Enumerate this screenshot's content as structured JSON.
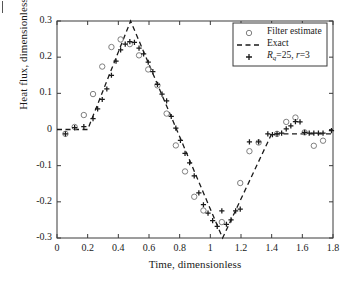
{
  "chart_data": {
    "type": "line",
    "title": "",
    "xlabel": "Time, dimensionless",
    "ylabel": "Heat flux, dimensionless",
    "xlim": [
      0,
      1.8
    ],
    "ylim": [
      -0.3,
      0.3
    ],
    "xticks": [
      "0",
      "0.2",
      "0.4",
      "0.6",
      "0.8",
      "1",
      "1.2",
      "1.4",
      "1.6",
      "1.8"
    ],
    "xtickvals": [
      0,
      0.2,
      0.4,
      0.6,
      0.8,
      1.0,
      1.2,
      1.4,
      1.6,
      1.8
    ],
    "yticks": [
      "0.3",
      "0.2",
      "0.1",
      "0",
      "-0.1",
      "-0.2",
      "-0.3"
    ],
    "ytickvals": [
      0.3,
      0.2,
      0.1,
      0,
      -0.1,
      -0.2,
      -0.3
    ],
    "grid": false,
    "legend_position": "top-right",
    "series": [
      {
        "name": "Filter estimate",
        "marker": "circle",
        "style": "markers",
        "color": "#808080",
        "points": [
          [
            0.055,
            -0.012
          ],
          [
            0.115,
            0.007
          ],
          [
            0.175,
            0.04
          ],
          [
            0.235,
            0.098
          ],
          [
            0.295,
            0.174
          ],
          [
            0.355,
            0.228
          ],
          [
            0.415,
            0.249
          ],
          [
            0.475,
            0.236
          ],
          [
            0.535,
            0.205
          ],
          [
            0.595,
            0.166
          ],
          [
            0.655,
            0.122
          ],
          [
            0.715,
            0.044
          ],
          [
            0.775,
            -0.044
          ],
          [
            0.835,
            -0.116
          ],
          [
            0.895,
            -0.186
          ],
          [
            0.955,
            -0.224
          ],
          [
            1.075,
            -0.256
          ],
          [
            1.195,
            -0.148
          ],
          [
            1.255,
            -0.06
          ],
          [
            1.315,
            -0.036
          ],
          [
            1.435,
            -0.012
          ],
          [
            1.495,
            0.021
          ],
          [
            1.555,
            0.033
          ],
          [
            1.615,
            -0.008
          ],
          [
            1.675,
            -0.045
          ],
          [
            1.735,
            -0.031
          ]
        ]
      },
      {
        "name": "Exact",
        "marker": "none",
        "style": "dashed-line",
        "color": "#1a1a1a",
        "points": [
          [
            0.0,
            0.0
          ],
          [
            0.2,
            0.0
          ],
          [
            0.48,
            0.3
          ],
          [
            1.08,
            -0.3
          ],
          [
            1.4,
            -0.012
          ],
          [
            1.8,
            -0.012
          ]
        ]
      },
      {
        "name": "Rq = 25, r = 3",
        "name_parts": {
          "symbol": "R",
          "subscript": "q",
          "value": "25",
          "r_symbol": "r",
          "r_value": "3"
        },
        "marker": "plus",
        "style": "markers",
        "color": "#1a1a1a",
        "points": [
          [
            0.055,
            -0.012
          ],
          [
            0.115,
            0.005
          ],
          [
            0.175,
            0.008
          ],
          [
            0.235,
            0.03
          ],
          [
            0.265,
            0.057
          ],
          [
            0.295,
            0.083
          ],
          [
            0.325,
            0.112
          ],
          [
            0.355,
            0.15
          ],
          [
            0.385,
            0.189
          ],
          [
            0.415,
            0.22
          ],
          [
            0.445,
            0.236
          ],
          [
            0.475,
            0.243
          ],
          [
            0.505,
            0.241
          ],
          [
            0.535,
            0.225
          ],
          [
            0.565,
            0.209
          ],
          [
            0.595,
            0.186
          ],
          [
            0.625,
            0.16
          ],
          [
            0.655,
            0.125
          ],
          [
            0.685,
            0.098
          ],
          [
            0.715,
            0.079
          ],
          [
            0.745,
            0.036
          ],
          [
            0.775,
            0.004
          ],
          [
            0.805,
            -0.03
          ],
          [
            0.835,
            -0.066
          ],
          [
            0.865,
            -0.092
          ],
          [
            0.895,
            -0.128
          ],
          [
            0.925,
            -0.175
          ],
          [
            0.955,
            -0.208
          ],
          [
            0.985,
            -0.231
          ],
          [
            1.015,
            -0.252
          ],
          [
            1.045,
            -0.268
          ],
          [
            1.075,
            -0.225
          ],
          [
            1.105,
            -0.262
          ],
          [
            1.135,
            -0.25
          ],
          [
            1.165,
            -0.225
          ],
          [
            1.195,
            -0.22
          ],
          [
            1.255,
            -0.034
          ],
          [
            1.315,
            -0.034
          ],
          [
            1.375,
            -0.012
          ],
          [
            1.405,
            -0.014
          ],
          [
            1.435,
            -0.012
          ],
          [
            1.465,
            -0.01
          ],
          [
            1.495,
            0.002
          ],
          [
            1.525,
            0.01
          ],
          [
            1.555,
            0.022
          ],
          [
            1.585,
            0.021
          ],
          [
            1.615,
            -0.008
          ],
          [
            1.645,
            -0.01
          ],
          [
            1.675,
            -0.01
          ],
          [
            1.705,
            -0.01
          ],
          [
            1.735,
            -0.01
          ],
          [
            1.79,
            -0.003
          ]
        ]
      }
    ]
  },
  "legend": {
    "items": [
      {
        "label": "Filter estimate",
        "glyph": "circle-marker"
      },
      {
        "label": "Exact",
        "glyph": "dashed-line"
      },
      {
        "label": "Rq=25, r=3",
        "glyph": "plus-marker"
      }
    ]
  }
}
